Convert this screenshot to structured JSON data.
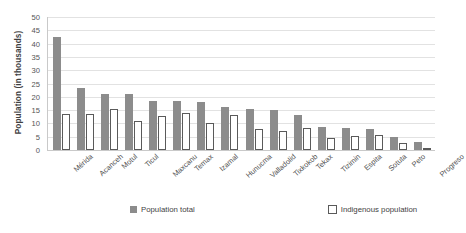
{
  "chart_data": {
    "type": "bar",
    "title": "",
    "xlabel": "",
    "ylabel": "Population (in thousands)",
    "ylim": [
      0,
      50
    ],
    "ytick_values": [
      0,
      5,
      10,
      15,
      20,
      25,
      30,
      35,
      40,
      45,
      50
    ],
    "ytick_labels": [
      "0",
      "5",
      "10",
      "15",
      "20",
      "25",
      "30",
      "35",
      "40",
      "45",
      "50"
    ],
    "grid": true,
    "legend_position": "bottom",
    "categories": [
      "Mérida",
      "Acanceh",
      "Motul",
      "Ticul",
      "Maxcanu",
      "Temax",
      "Izamal",
      "Hunucma",
      "Valladolid",
      "Tixkokob",
      "Tekax",
      "Tizimin",
      "Espita",
      "Sotuta",
      "Peto",
      "Progreso"
    ],
    "series": [
      {
        "name": "Population total",
        "color": "#8c8c8c",
        "values": [
          42.5,
          23.2,
          21.2,
          20.9,
          18.5,
          18.3,
          18.0,
          16.2,
          15.4,
          15.2,
          13.2,
          8.5,
          8.3,
          8.0,
          5.0,
          3.2
        ]
      },
      {
        "name": "Indigenous population",
        "color": "#ffffff",
        "values": [
          13.4,
          13.4,
          15.4,
          10.8,
          12.8,
          14.1,
          10.0,
          13.2,
          7.8,
          7.0,
          8.2,
          4.4,
          5.2,
          5.5,
          2.7,
          0.8
        ]
      }
    ]
  },
  "legend": {
    "items": [
      {
        "label": "Population total",
        "marker": "filled-square-swatch"
      },
      {
        "label": "Indigenous population",
        "marker": "outlined-square-swatch"
      }
    ]
  }
}
